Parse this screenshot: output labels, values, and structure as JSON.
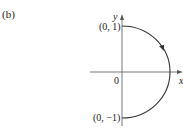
{
  "figure": {
    "panel_label": "(b)",
    "axes": {
      "x_label": "x",
      "y_label": "y",
      "origin_label": "0"
    },
    "points": [
      {
        "label": "(0, 1)",
        "x": 0,
        "y": 1
      },
      {
        "label": "(0, −1)",
        "x": 0,
        "y": -1
      }
    ],
    "curve": {
      "type": "right semicircle",
      "from": "(0, 1)",
      "to": "(0, -1)",
      "direction": "clockwise",
      "color": "#333333"
    }
  }
}
